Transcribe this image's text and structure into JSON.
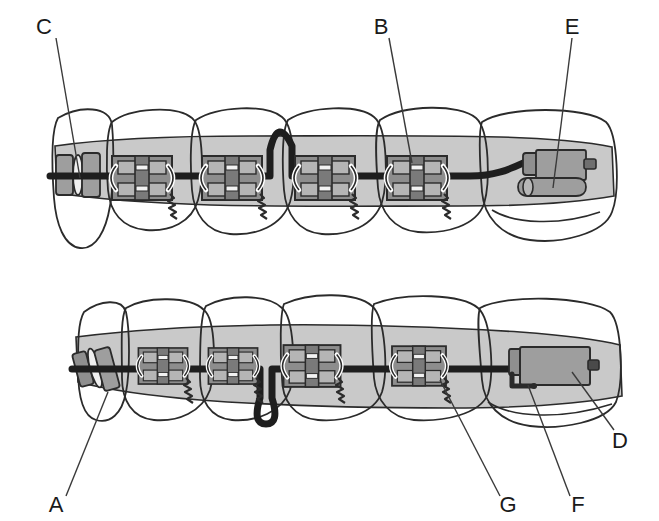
{
  "figure": {
    "type": "dental-orthodontic-diagram",
    "background_color": "#ffffff",
    "arches": [
      {
        "name": "upper-arch",
        "position": "top",
        "teeth_count": 5,
        "has_archwire": true,
        "loop_direction": "up",
        "terminal_appliance": "buccal-tube"
      },
      {
        "name": "lower-arch",
        "position": "bottom",
        "teeth_count": 5,
        "has_archwire": true,
        "loop_direction": "down",
        "terminal_appliance": "molar-band"
      }
    ],
    "colors": {
      "outline": "#2b2b2b",
      "tooth_fill": "#ffffff",
      "gingiva_fill": "#c9c9c9",
      "band_fill": "#a0a0a0",
      "bracket_fill": "#9a9a9a",
      "bracket_dark": "#6f6f6f",
      "wire": "#1e1e1e",
      "appliance_fill": "#9e9e9e",
      "appliance_shadow": "#7d7d7d",
      "leader_line": "#3a3a3a",
      "label_text": "#1a1a1a"
    }
  },
  "labels": [
    {
      "id": "label-c",
      "text": "C",
      "x": 50,
      "y": 26,
      "target_x": 76,
      "target_y": 172,
      "arch": "upper",
      "refers_to": "molar-band"
    },
    {
      "id": "label-b",
      "text": "B",
      "x": 383,
      "y": 26,
      "target_x": 412,
      "target_y": 163,
      "arch": "upper",
      "refers_to": "bracket"
    },
    {
      "id": "label-e",
      "text": "E",
      "x": 572,
      "y": 26,
      "target_x": 553,
      "target_y": 182,
      "arch": "upper",
      "refers_to": "buccal-tube"
    },
    {
      "id": "label-a",
      "text": "A",
      "x": 54,
      "y": 506,
      "target_x": 106,
      "target_y": 396,
      "arch": "lower",
      "refers_to": "tooth"
    },
    {
      "id": "label-g",
      "text": "G",
      "x": 504,
      "y": 506,
      "target_x": 438,
      "target_y": 381,
      "arch": "lower",
      "refers_to": "coil-spring"
    },
    {
      "id": "label-f",
      "text": "F",
      "x": 573,
      "y": 506,
      "target_x": 527,
      "target_y": 384,
      "arch": "lower",
      "refers_to": "hook"
    },
    {
      "id": "label-d",
      "text": "D",
      "x": 619,
      "y": 441,
      "target_x": 573,
      "target_y": 374,
      "arch": "lower",
      "refers_to": "molar-band-body"
    }
  ],
  "legend_keys": [
    "A",
    "B",
    "C",
    "D",
    "E",
    "F",
    "G"
  ],
  "upper_brackets": [
    {
      "id": "upper-bracket-1",
      "cx": 142,
      "cy": 178
    },
    {
      "id": "upper-bracket-2",
      "cx": 232,
      "cy": 178
    },
    {
      "id": "upper-bracket-3",
      "cx": 325,
      "cy": 178
    },
    {
      "id": "upper-bracket-4",
      "cx": 417,
      "cy": 178
    }
  ],
  "lower_brackets": [
    {
      "id": "lower-bracket-1",
      "cx": 163,
      "cy": 366
    },
    {
      "id": "lower-bracket-2",
      "cx": 233,
      "cy": 366
    },
    {
      "id": "lower-bracket-3",
      "cx": 312,
      "cy": 366
    },
    {
      "id": "lower-bracket-4",
      "cx": 419,
      "cy": 366
    }
  ]
}
